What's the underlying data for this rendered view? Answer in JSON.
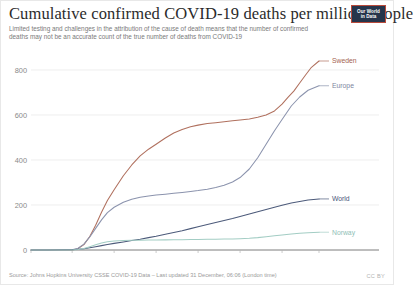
{
  "header": {
    "title": "Cumulative confirmed COVID-19 deaths per million people",
    "subtitle": "Limited testing and challenges in the attribution of the cause of death means that the number of confirmed deaths may not be an accurate count of the true number of deaths from COVID-19",
    "logo_line1": "Our World",
    "logo_line2": "in Data"
  },
  "footer": {
    "source": "Source: Johns Hopkins University CSSE COVID-19 Data – Last updated 31 December, 06:06 (London time)",
    "license": "CC BY"
  },
  "chart_data": {
    "type": "line",
    "title": "Cumulative confirmed COVID-19 deaths per million people",
    "subtitle": "Limited testing and challenges in the attribution of the cause of death means that the number of confirmed deaths may not be an accurate count of the true number of deaths from COVID-19",
    "xlabel": "",
    "ylabel": "",
    "grid": true,
    "legend_position": "right-inline-labels",
    "ylim": [
      0,
      880
    ],
    "yticks": [
      0,
      200,
      400,
      600,
      800
    ],
    "ytick_labels": [
      "0",
      "200",
      "400",
      "600",
      "800"
    ],
    "xticks": [
      0,
      49,
      99,
      149,
      199,
      249,
      299,
      343
    ],
    "xtick_labels": [
      "Jan 22, 2020",
      "Mar 11",
      "Apr 30",
      "Jun 19",
      "Aug 8",
      "Sep 27",
      "Nov 16",
      "Dec 30, 2020"
    ],
    "x_unit": "days since Jan 22, 2020",
    "x_domain": [
      0,
      343
    ],
    "series": [
      {
        "name": "Sweden",
        "color": "#b0705e",
        "label_color": "#a4634f",
        "final_value": 840,
        "x": [
          0,
          20,
          40,
          49,
          56,
          63,
          70,
          77,
          84,
          91,
          99,
          110,
          120,
          130,
          140,
          149,
          160,
          170,
          180,
          190,
          199,
          210,
          220,
          230,
          240,
          249,
          260,
          270,
          280,
          290,
          299,
          306,
          313,
          320,
          327,
          334,
          343
        ],
        "values": [
          0,
          0,
          0,
          0.3,
          6,
          24,
          60,
          110,
          168,
          220,
          268,
          330,
          378,
          418,
          448,
          470,
          498,
          520,
          536,
          548,
          555,
          562,
          566,
          570,
          574,
          578,
          582,
          590,
          600,
          618,
          648,
          678,
          706,
          742,
          778,
          812,
          840
        ]
      },
      {
        "name": "Europe",
        "color": "#8b93ad",
        "label_color": "#7d85a0",
        "final_value": 730,
        "x": [
          0,
          20,
          40,
          49,
          56,
          63,
          70,
          77,
          84,
          91,
          99,
          110,
          120,
          130,
          140,
          149,
          160,
          170,
          180,
          190,
          199,
          210,
          220,
          230,
          240,
          249,
          260,
          270,
          280,
          290,
          299,
          310,
          320,
          330,
          343
        ],
        "values": [
          0,
          0,
          0.4,
          1.5,
          8,
          26,
          58,
          96,
          134,
          166,
          190,
          212,
          226,
          234,
          240,
          244,
          248,
          252,
          256,
          260,
          264,
          270,
          278,
          288,
          302,
          322,
          360,
          410,
          470,
          530,
          580,
          640,
          680,
          710,
          730
        ]
      },
      {
        "name": "World",
        "color": "#4c5a7a",
        "label_color": "#49567a",
        "final_value": 227,
        "x": [
          0,
          20,
          40,
          49,
          56,
          63,
          70,
          77,
          84,
          91,
          99,
          110,
          120,
          130,
          140,
          149,
          160,
          170,
          180,
          190,
          199,
          210,
          220,
          230,
          240,
          249,
          260,
          270,
          280,
          290,
          299,
          310,
          320,
          330,
          343
        ],
        "values": [
          0,
          0.3,
          1.0,
          1.6,
          3.2,
          6.0,
          10.0,
          14.5,
          19.5,
          24.5,
          29.5,
          36,
          42,
          48,
          55,
          61,
          70,
          78,
          86,
          95,
          103,
          113,
          122,
          131,
          140,
          149,
          160,
          170,
          180,
          190,
          199,
          209,
          216,
          222,
          227
        ]
      },
      {
        "name": "Norway",
        "color": "#a3cdc4",
        "label_color": "#8fc0b6",
        "final_value": 79,
        "x": [
          0,
          20,
          40,
          49,
          56,
          63,
          70,
          77,
          84,
          91,
          99,
          110,
          120,
          130,
          140,
          149,
          160,
          170,
          180,
          190,
          199,
          210,
          220,
          230,
          240,
          249,
          260,
          270,
          280,
          290,
          299,
          310,
          320,
          330,
          343
        ],
        "values": [
          0,
          0,
          0,
          0.2,
          2.5,
          7,
          15,
          23,
          31,
          37,
          40,
          42,
          43,
          43.5,
          44,
          44.5,
          45,
          45.5,
          46,
          46.5,
          47,
          47.5,
          48,
          48.5,
          49,
          50,
          52,
          55,
          59,
          63,
          67,
          71,
          74,
          77,
          79
        ]
      }
    ]
  }
}
